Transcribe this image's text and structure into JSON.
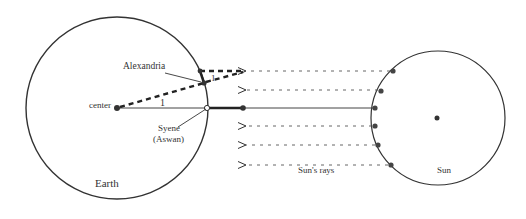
{
  "labels": {
    "alexandria": "Alexandria",
    "center": "center",
    "angle_center": "1",
    "angle_alex": "1",
    "syene_line1": "Syene",
    "syene_line2": "(Aswan)",
    "earth": "Earth",
    "suns_rays": "Sun's rays",
    "sun": "Sun"
  },
  "colors": {
    "stroke": "#333333",
    "text": "#333333",
    "background": "#ffffff"
  },
  "geometry": {
    "earth": {
      "cx": 117,
      "cy": 108,
      "r": 91
    },
    "sun": {
      "cx": 438,
      "cy": 118,
      "r": 67
    },
    "ray_y": [
      71,
      90,
      108,
      126,
      145,
      165
    ]
  }
}
